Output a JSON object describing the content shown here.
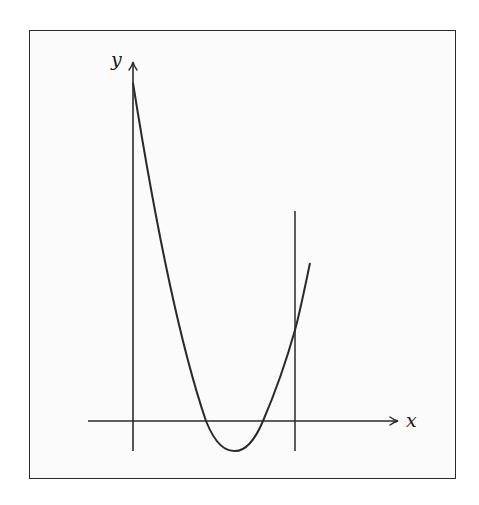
{
  "diagram": {
    "type": "function-graph",
    "axes": {
      "x_label": "x",
      "y_label": "y"
    },
    "colors": {
      "stroke": "#2a2a2a",
      "background": "#fbfbfb",
      "frame": "#2a2a2a"
    },
    "elements": [
      {
        "kind": "y-axis",
        "x": 133,
        "y_top": 62,
        "y_bottom": 451,
        "arrow": "up"
      },
      {
        "kind": "x-axis",
        "y": 421,
        "x_left": 88,
        "x_right": 398,
        "arrow": "right"
      },
      {
        "kind": "vertical-line",
        "x": 295,
        "y_top": 211,
        "y_bottom": 451
      },
      {
        "kind": "curve",
        "shape": "parabola-like",
        "start": [
          133,
          83
        ],
        "x_intercepts": [
          206,
          263
        ],
        "minimum": [
          235,
          451
        ],
        "end": [
          310,
          263
        ]
      }
    ]
  }
}
